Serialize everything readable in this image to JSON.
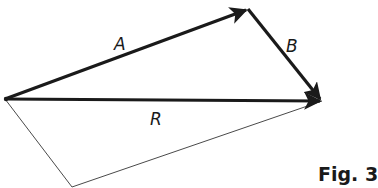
{
  "figure": {
    "caption": "Fig. 3",
    "colors": {
      "vector": "#1a1a1a",
      "construction_line": "#4a4a4a",
      "background": "#ffffff"
    }
  },
  "vectors": [
    {
      "label": "A",
      "from": [
        5,
        99
      ],
      "to": [
        248,
        9
      ]
    },
    {
      "label": "B",
      "from": [
        248,
        9
      ],
      "to": [
        322,
        101
      ]
    },
    {
      "label": "R",
      "from": [
        5,
        99
      ],
      "to": [
        322,
        101
      ]
    }
  ],
  "construction_lines": [
    {
      "from": [
        5,
        99
      ],
      "to": [
        72,
        187
      ]
    },
    {
      "from": [
        72,
        187
      ],
      "to": [
        322,
        101
      ]
    }
  ],
  "labels": {
    "a": "A",
    "b": "B",
    "r": "R"
  }
}
